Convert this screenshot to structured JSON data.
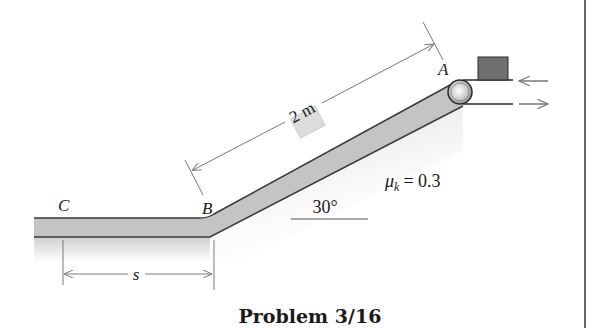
{
  "figure": {
    "caption": "Problem 3/16",
    "labels": {
      "point_a": "A",
      "point_b": "B",
      "point_c": "C"
    },
    "dimensions": {
      "incline_length": "2 m",
      "flat_distance": "s"
    },
    "angle": "30°",
    "friction": {
      "symbol": "μ",
      "subscript": "k",
      "value": "= 0.3"
    },
    "colors": {
      "surface_fill": "#c4c4c4",
      "surface_edge": "#3a3a3a",
      "shadow": "#d9d9d9",
      "block_dark": "#6f6f6f",
      "block_light": "#dcdcdc",
      "dim_line": "#7a7a7a",
      "border": "#333333"
    }
  }
}
